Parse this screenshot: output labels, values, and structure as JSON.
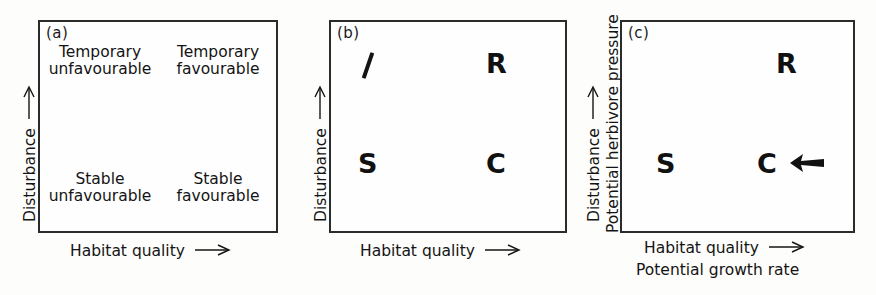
{
  "figure": {
    "background_color": "#fdfdfb",
    "ink_color": "#1a1a1a",
    "panel_count": 3
  },
  "panels": {
    "a": {
      "tag": "(a)",
      "y_axis_label": "Disturbance",
      "y_axis_arrow": "up-arrow-glyph",
      "x_axis_label": "Habitat quality",
      "x_axis_arrow": "right-arrow-glyph",
      "quadrants": {
        "top_left": {
          "line1": "Temporary",
          "line2": "unfavourable"
        },
        "top_right": {
          "line1": "Temporary",
          "line2": "favourable"
        },
        "bottom_left": {
          "line1": "Stable",
          "line2": "unfavourable"
        },
        "bottom_right": {
          "line1": "Stable",
          "line2": "favourable"
        }
      }
    },
    "b": {
      "tag": "(b)",
      "y_axis_label": "Disturbance",
      "y_axis_arrow": "up-arrow-glyph",
      "x_axis_label": "Habitat quality",
      "x_axis_arrow": "right-arrow-glyph",
      "markers": {
        "top_left": "I",
        "top_right": "R",
        "bottom_left": "S",
        "bottom_right": "C"
      }
    },
    "c": {
      "tag": "(c)",
      "y_axis_label_outer": "Disturbance",
      "y_axis_arrow": "up-arrow-glyph",
      "y_axis_label_inner": "Potential herbivore pressure",
      "x_axis_label_upper": "Habitat quality",
      "x_axis_arrow": "right-arrow-glyph",
      "x_axis_label_lower": "Potential growth rate",
      "markers": {
        "top_right": "R",
        "bottom_left": "S",
        "bottom_right": "C"
      },
      "annotation_arrow": "bold-left-arrow-icon"
    }
  }
}
